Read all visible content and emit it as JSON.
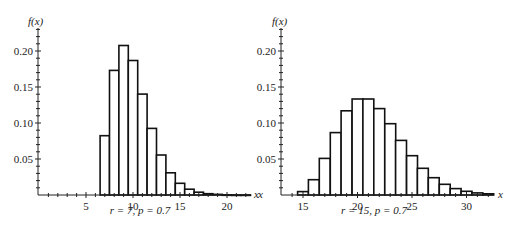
{
  "figure": {
    "panels": [
      {
        "ylabel": "f(x)",
        "xlabel": "x",
        "caption": "r = 7, p = 0.7"
      },
      {
        "ylabel": "f(x)",
        "xlabel": "x",
        "caption": "r = 15, p = 0.7"
      }
    ]
  },
  "chart_data": [
    {
      "type": "bar",
      "title": "r = 7, p = 0.7",
      "xlabel": "x",
      "ylabel": "f(x)",
      "x": [
        7,
        8,
        9,
        10,
        11,
        12,
        13,
        14,
        15,
        16,
        17,
        18,
        19,
        20,
        21,
        22
      ],
      "values": [
        0.0824,
        0.173,
        0.2076,
        0.1868,
        0.1401,
        0.0925,
        0.0555,
        0.0309,
        0.0162,
        0.0081,
        0.0039,
        0.0018,
        0.0008,
        0.0003,
        0.0001,
        0.0001
      ],
      "xticks": [
        5,
        10,
        15,
        20
      ],
      "yticks": [
        0.05,
        0.1,
        0.15,
        0.2
      ],
      "ytick_labels": [
        "0.05",
        "0.10",
        "0.15",
        "0.20"
      ],
      "xlim": [
        0,
        22.5
      ],
      "ylim": [
        0,
        0.23
      ],
      "grid": false
    },
    {
      "type": "bar",
      "title": "r = 15, p = 0.7",
      "xlabel": "x",
      "ylabel": "f(x)",
      "x": [
        15,
        16,
        17,
        18,
        19,
        20,
        21,
        22,
        23,
        24,
        25,
        26,
        27,
        28,
        29,
        30,
        31,
        32
      ],
      "values": [
        0.0047,
        0.0212,
        0.0509,
        0.0866,
        0.1169,
        0.1333,
        0.1333,
        0.12,
        0.099,
        0.0759,
        0.0546,
        0.0371,
        0.024,
        0.0149,
        0.0089,
        0.0051,
        0.0029,
        0.0016
      ],
      "xticks": [
        15,
        20,
        25,
        30
      ],
      "yticks": [
        0.05,
        0.1,
        0.15,
        0.2
      ],
      "ytick_labels": [
        "0.05",
        "0.10",
        "0.15",
        "0.20"
      ],
      "xlim": [
        13,
        32.5
      ],
      "ylim": [
        0,
        0.23
      ],
      "grid": false
    }
  ]
}
